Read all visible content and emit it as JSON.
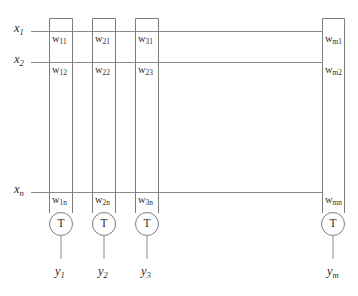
{
  "diagram": {
    "colors": {
      "background": "#ffffff",
      "line": "#8a8a8a",
      "box": "#7d7d7d",
      "text": "#2a2a2a"
    },
    "inputs": [
      {
        "name": "x-input-1",
        "base": "x",
        "sub": "1",
        "y": 31
      },
      {
        "name": "x-input-2",
        "base": "x",
        "sub": "2",
        "y": 62
      },
      {
        "name": "x-input-n",
        "base": "x",
        "sub": "n",
        "y": 192
      }
    ],
    "columns": [
      {
        "name": "neuron-column-1",
        "x_left": 49,
        "x_right": 73,
        "threshold": "T",
        "output": {
          "base": "y",
          "sub": "1"
        },
        "weights": [
          {
            "base": "w",
            "sub": "11"
          },
          {
            "base": "w",
            "sub": "12"
          },
          {
            "base": "w",
            "sub": "1n"
          }
        ]
      },
      {
        "name": "neuron-column-2",
        "x_left": 92,
        "x_right": 116,
        "threshold": "T",
        "output": {
          "base": "y",
          "sub": "2"
        },
        "weights": [
          {
            "base": "w",
            "sub": "21"
          },
          {
            "base": "w",
            "sub": "22"
          },
          {
            "base": "w",
            "sub": "2n"
          }
        ]
      },
      {
        "name": "neuron-column-3",
        "x_left": 135,
        "x_right": 159,
        "threshold": "T",
        "output": {
          "base": "y",
          "sub": "3"
        },
        "weights": [
          {
            "base": "w",
            "sub": "31"
          },
          {
            "base": "w",
            "sub": "23"
          },
          {
            "base": "w",
            "sub": "3n"
          }
        ]
      },
      {
        "name": "neuron-column-m",
        "x_left": 322,
        "x_right": 345,
        "threshold": "T",
        "output": {
          "base": "y",
          "sub": "m"
        },
        "weights": [
          {
            "base": "w",
            "sub": "m1"
          },
          {
            "base": "w",
            "sub": "m2"
          },
          {
            "base": "w",
            "sub": "mn"
          }
        ]
      }
    ],
    "geometry": {
      "box_top": 18,
      "column_bottom": 213,
      "circle_cy": 224,
      "circle_r": 11.5,
      "output_stub_bottom": 259,
      "wire_x_start": 31,
      "wire_x_end": 322
    }
  }
}
